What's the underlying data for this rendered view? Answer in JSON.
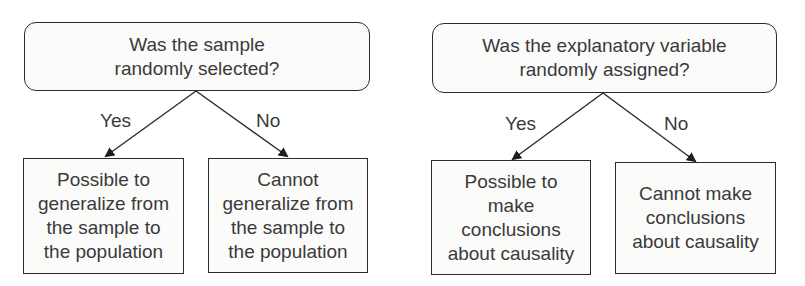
{
  "diagrams": [
    {
      "question": "Was the sample\nrandomly selected?",
      "yes_label": "Yes",
      "no_label": "No",
      "yes_outcome": "Possible to\ngeneralize from\nthe sample to\nthe population",
      "no_outcome": "Cannot\ngeneralize from\nthe sample to\nthe population"
    },
    {
      "question": "Was the explanatory variable\nrandomly assigned?",
      "yes_label": "Yes",
      "no_label": "No",
      "yes_outcome": "Possible to\nmake\nconclusions\nabout causality",
      "no_outcome": "Cannot make\nconclusions\nabout causality"
    }
  ],
  "colors": {
    "stroke": "#2b2b2b",
    "text": "#3a3a3a",
    "box_fill": "#fbfbfa"
  }
}
